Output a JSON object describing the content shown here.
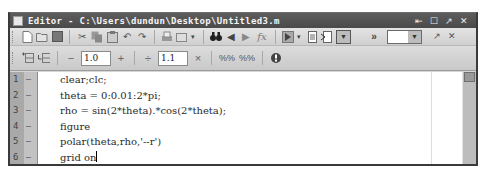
{
  "window": {
    "title": "Editor - C:\\Users\\dundun\\Desktop\\Untitled3.m",
    "controls": {
      "dock": "⇤",
      "maximize": "☐",
      "undock": "↗",
      "close": "✕"
    }
  },
  "toolbar1": {
    "icons": [
      "new-file",
      "open-file",
      "save",
      "cut",
      "copy",
      "paste",
      "undo",
      "redo",
      "print",
      "print-options",
      "find",
      "back",
      "forward",
      "function-fx",
      "run",
      "run-section",
      "evaluate-cell",
      "cell-options"
    ],
    "function_label": "fx",
    "more_label": "»"
  },
  "toolbar2": {
    "decrement_label": "−",
    "first_value": "1.0",
    "increment_label": "+",
    "divide_label": "÷",
    "second_value": "1.1",
    "multiply_label": "×"
  },
  "editor": {
    "lines": [
      {
        "number": "1",
        "mark": "–",
        "code": "clear;clc;"
      },
      {
        "number": "2",
        "mark": "–",
        "code": "theta = 0:0.01:2*pi;"
      },
      {
        "number": "3",
        "mark": "–",
        "code": "rho = sin(2*theta).*cos(2*theta);"
      },
      {
        "number": "4",
        "mark": "–",
        "code": "figure"
      },
      {
        "number": "5",
        "mark": "–",
        "code": "polar(theta,rho,'--r')"
      },
      {
        "number": "6",
        "mark": "–",
        "code": "grid on"
      }
    ]
  }
}
